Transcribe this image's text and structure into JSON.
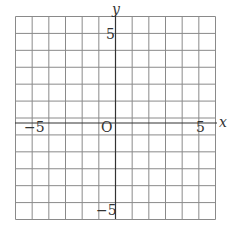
{
  "diagram": {
    "type": "coordinate-grid",
    "x_range": [
      -6,
      6
    ],
    "y_range": [
      -6,
      6
    ],
    "grid_step": 1,
    "axis_labels": {
      "x": "x",
      "y": "y"
    },
    "origin_label": "O",
    "tick_labels": {
      "x_neg": "−5",
      "x_pos": "5",
      "y_pos": "5",
      "y_neg": "−5"
    },
    "colors": {
      "grid": "#888888",
      "axis": "#333333"
    }
  }
}
